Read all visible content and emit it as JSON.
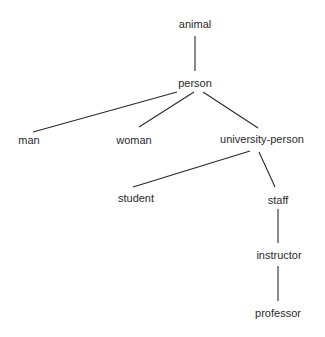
{
  "diagram": {
    "type": "tree",
    "nodes": [
      {
        "id": "animal",
        "label": "animal",
        "x": 195,
        "y": 24
      },
      {
        "id": "person",
        "label": "person",
        "x": 195,
        "y": 83
      },
      {
        "id": "man",
        "label": "man",
        "x": 29,
        "y": 140
      },
      {
        "id": "woman",
        "label": "woman",
        "x": 134,
        "y": 140
      },
      {
        "id": "university-person",
        "label": "university-person",
        "x": 262,
        "y": 139
      },
      {
        "id": "student",
        "label": "student",
        "x": 136,
        "y": 198
      },
      {
        "id": "staff",
        "label": "staff",
        "x": 278,
        "y": 200
      },
      {
        "id": "instructor",
        "label": "instructor",
        "x": 279,
        "y": 255
      },
      {
        "id": "professor",
        "label": "professor",
        "x": 278,
        "y": 313
      }
    ],
    "edges": [
      {
        "from": "animal",
        "to": "person",
        "x1": 195,
        "y1": 36,
        "x2": 195,
        "y2": 71
      },
      {
        "from": "person",
        "to": "man",
        "x1": 177,
        "y1": 92,
        "x2": 33,
        "y2": 132
      },
      {
        "from": "person",
        "to": "woman",
        "x1": 194,
        "y1": 92,
        "x2": 139,
        "y2": 127
      },
      {
        "from": "person",
        "to": "university-person",
        "x1": 203,
        "y1": 92,
        "x2": 258,
        "y2": 128
      },
      {
        "from": "university-person",
        "to": "student",
        "x1": 250,
        "y1": 151,
        "x2": 133,
        "y2": 187
      },
      {
        "from": "university-person",
        "to": "staff",
        "x1": 259,
        "y1": 152,
        "x2": 275,
        "y2": 187
      },
      {
        "from": "staff",
        "to": "instructor",
        "x1": 278,
        "y1": 209,
        "x2": 278,
        "y2": 243
      },
      {
        "from": "instructor",
        "to": "professor",
        "x1": 278,
        "y1": 266,
        "x2": 278,
        "y2": 301
      }
    ],
    "line_color": "#2a2a2a",
    "text_color": "#2a2a2a"
  }
}
